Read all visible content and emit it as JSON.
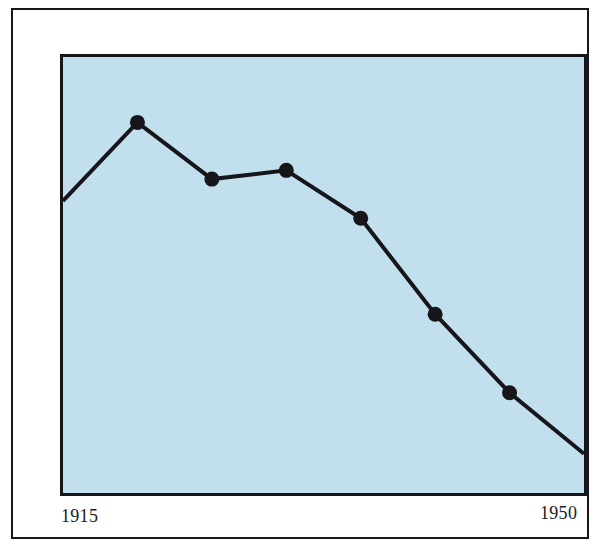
{
  "figure": {
    "name": "line-chart-figure",
    "background_color": "#ffffff",
    "frame_color": "#17171a",
    "plot_background_color": "#c2dfee",
    "series_color": "#16161a"
  },
  "axis": {
    "x_start_label": "1915",
    "x_end_label": "1950"
  },
  "chart_data": {
    "type": "line",
    "title": "",
    "subtitle": "",
    "xlabel": "",
    "ylabel": "",
    "grid": false,
    "legend": false,
    "legend_position": "none",
    "xlim": [
      1915,
      1950
    ],
    "ylim": [
      0,
      100
    ],
    "x_tick_labels": [
      "1915",
      "1950"
    ],
    "y_tick_labels": [],
    "annotations": [],
    "marker_style": "filled-circle",
    "marker_color": "#16161a",
    "line_color": "#16161a",
    "line_width": 4,
    "x": [
      1915,
      1920,
      1925,
      1930,
      1935,
      1940,
      1945,
      1950
    ],
    "values": [
      67,
      85,
      72,
      74,
      63,
      41,
      23,
      9
    ],
    "series": [
      {
        "name": "value",
        "x": [
          1915,
          1920,
          1925,
          1930,
          1935,
          1940,
          1945,
          1950
        ],
        "values": [
          67,
          85,
          72,
          74,
          63,
          41,
          23,
          9
        ],
        "markers_shown": [
          false,
          true,
          true,
          true,
          true,
          true,
          true,
          false
        ]
      }
    ],
    "points": [
      {
        "x": 1915,
        "y": 67,
        "marker": false
      },
      {
        "x": 1920,
        "y": 85,
        "marker": true
      },
      {
        "x": 1925,
        "y": 72,
        "marker": true
      },
      {
        "x": 1930,
        "y": 74,
        "marker": true
      },
      {
        "x": 1935,
        "y": 63,
        "marker": true
      },
      {
        "x": 1940,
        "y": 41,
        "marker": true
      },
      {
        "x": 1945,
        "y": 23,
        "marker": true
      },
      {
        "x": 1950,
        "y": 9,
        "marker": false
      }
    ]
  }
}
